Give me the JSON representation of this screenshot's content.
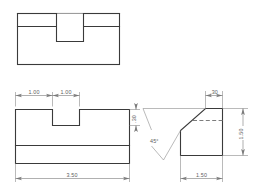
{
  "drawing": {
    "title": "Multiview Engineering Drawing",
    "sheet_background": "#ffffff",
    "object_line_color": "#3a3a3a",
    "hidden_line_color": "#7d7d7d",
    "dimension_line_color": "#7a7a7a",
    "dimension_text_color": "#5d5d5d"
  },
  "views": {
    "top_view": {
      "name": "Top View",
      "description": "Rectangular plate with rectangular notch opening at top center"
    },
    "front_view": {
      "name": "Front View",
      "description": "Stepped block with a rectangular slot cut into the top face and a horizontal base band"
    },
    "side_view": {
      "name": "Right Side View",
      "description": "Polygon with 45 degree chamfered upper left corner and hidden line"
    }
  },
  "dimensions": {
    "front_notch_left": "1.00",
    "front_notch_width": "1.00",
    "front_overall_width": "3.50",
    "front_notch_depth": ".30",
    "side_top_flat": ".30",
    "side_height": "1.50",
    "side_width": "1.50",
    "side_chamfer_angle": "45°"
  }
}
